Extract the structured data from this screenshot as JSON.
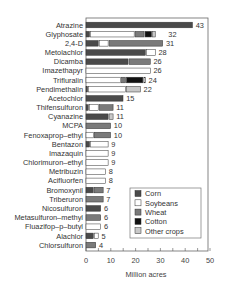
{
  "chart_data": {
    "type": "bar",
    "orientation": "horizontal",
    "stacked": true,
    "title": "",
    "xlabel": "Million acres",
    "ylabel": "",
    "xlim": [
      0,
      50
    ],
    "xticks": [
      0,
      10,
      20,
      30,
      40,
      50
    ],
    "grid": false,
    "legend_position": "lower right inside",
    "categories": [
      "Atrazine",
      "Glyphosate",
      "2,4-D",
      "Metolachlor",
      "Dicamba",
      "Imazethapyr",
      "Trifluralin",
      "Pendimethalin",
      "Acetochlor",
      "Thifensulfuron",
      "Cyanazine",
      "MCPA",
      "Fenoxaprop–ethyl",
      "Bentazon",
      "Imazaquin",
      "Chlorimuron–ethyl",
      "Metribuzin",
      "Acifluorfen",
      "Bromoxynil",
      "Triberuron",
      "Nicosulfuron",
      "Metasulfuron–methyl",
      "Fluazifop–p–butyl",
      "Alachlor",
      "Chlorsulfuron"
    ],
    "totals": [
      43,
      32,
      31,
      28,
      26,
      26,
      24,
      22,
      15,
      11,
      11,
      10,
      10,
      9,
      9,
      9,
      8,
      8,
      7,
      7,
      6,
      6,
      6,
      5,
      4
    ],
    "series": [
      {
        "name": "Corn",
        "color": "#4a4a4a",
        "values": [
          43,
          1.5,
          5,
          24,
          17,
          0,
          0,
          0.7,
          15,
          1,
          9,
          0,
          0,
          1.5,
          0,
          0,
          0,
          0,
          3,
          0,
          6,
          0,
          0,
          3,
          0
        ]
      },
      {
        "name": "Soybeans",
        "color": "#ffffff",
        "values": [
          0,
          18,
          4,
          4,
          0,
          26,
          14,
          15.3,
          0,
          4,
          0,
          0,
          3,
          7.5,
          9,
          9,
          8,
          8,
          0,
          0,
          0,
          0,
          6,
          2,
          0
        ]
      },
      {
        "name": "Wheat",
        "color": "#7a7a7a",
        "values": [
          0,
          4,
          22,
          0,
          9,
          0,
          2,
          0,
          0,
          6,
          0,
          10,
          7,
          0,
          0,
          0,
          0,
          0,
          4,
          7,
          0,
          6,
          0,
          0,
          4
        ]
      },
      {
        "name": "Cotton",
        "color": "#111111",
        "values": [
          0,
          3,
          0,
          0,
          0,
          0,
          7,
          0,
          0,
          0,
          0,
          0,
          0,
          0,
          0,
          0,
          0,
          0,
          0,
          0,
          0,
          0,
          0,
          0,
          0
        ]
      },
      {
        "name": "Other crops",
        "color": "#c8c8c8",
        "values": [
          0,
          1.5,
          0,
          0,
          0,
          0,
          1,
          6,
          0,
          0,
          2,
          0,
          0,
          0,
          0,
          0,
          0,
          0,
          0,
          0,
          0,
          0,
          0,
          0,
          0
        ]
      }
    ]
  },
  "legend": {
    "items": [
      {
        "label": "Corn",
        "color": "#4a4a4a"
      },
      {
        "label": "Soybeans",
        "color": "#ffffff"
      },
      {
        "label": "Wheat",
        "color": "#7a7a7a"
      },
      {
        "label": "Cotton",
        "color": "#111111"
      },
      {
        "label": "Other crops",
        "color": "#c8c8c8"
      }
    ]
  }
}
